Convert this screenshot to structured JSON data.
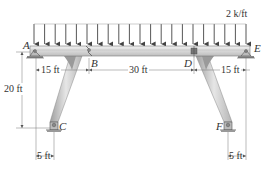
{
  "diagram": {
    "type": "structural-frame",
    "load": {
      "label": "2 k/ft",
      "type": "uniform-distributed",
      "direction": "down",
      "arrow_count": 21
    },
    "points": {
      "A": "A",
      "B": "B",
      "C": "C",
      "D": "D",
      "E": "E",
      "F": "F"
    },
    "dimensions": {
      "AB": "15 ft",
      "BD": "30 ft",
      "DE": "15 ft",
      "height": "20 ft",
      "C_offset": "5 ft",
      "F_offset": "5 ft"
    },
    "colors": {
      "beam": "#d9d9d9",
      "beam_edge": "#8a8a8a",
      "column": "#bdbdbd",
      "arrow": "#444444",
      "text": "#333333",
      "dim_line": "#777777"
    }
  }
}
